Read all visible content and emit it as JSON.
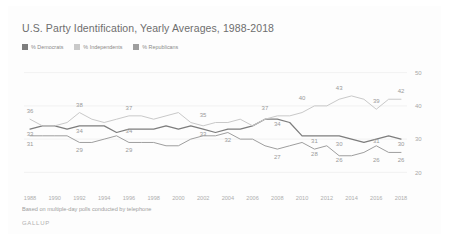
{
  "chart_data": {
    "type": "line",
    "title": "U.S. Party Identification, Yearly Averages, 1988-2018",
    "xlabel": "",
    "ylabel": "",
    "ylim": [
      15,
      52
    ],
    "xlim": [
      1988,
      2018
    ],
    "grid": true,
    "legend_position": "top-left",
    "footnote": "Based on multiple-day polls conducted by telephone",
    "brand": "GALLUP",
    "yticks": [
      50,
      40,
      30,
      20
    ],
    "xticks": [
      1988,
      1990,
      1992,
      1994,
      1996,
      1998,
      2000,
      2002,
      2004,
      2006,
      2008,
      2010,
      2012,
      2014,
      2016,
      2018
    ],
    "x": [
      1988,
      1989,
      1990,
      1991,
      1992,
      1993,
      1994,
      1995,
      1996,
      1997,
      1998,
      1999,
      2000,
      2001,
      2002,
      2003,
      2004,
      2005,
      2006,
      2007,
      2008,
      2009,
      2010,
      2011,
      2012,
      2013,
      2014,
      2015,
      2016,
      2017,
      2018
    ],
    "series": [
      {
        "name": "% Democrats",
        "color": "#7d7d7d",
        "values": [
          33,
          34,
          34,
          33,
          34,
          34,
          34,
          32,
          33,
          33,
          33,
          34,
          33,
          34,
          33,
          32,
          33,
          33,
          34,
          36,
          36,
          35,
          31,
          31,
          31,
          31,
          30,
          29,
          30,
          31,
          30
        ]
      },
      {
        "name": "% Independents",
        "color": "#c9c9c9",
        "values": [
          36,
          34,
          34,
          35,
          38,
          36,
          35,
          36,
          37,
          37,
          36,
          37,
          38,
          35,
          34,
          35,
          35,
          36,
          34,
          36,
          37,
          37,
          38,
          40,
          40,
          42,
          43,
          42,
          39,
          42,
          42
        ]
      },
      {
        "name": "% Republicans",
        "color": "#9e9e9e",
        "values": [
          31,
          31,
          31,
          31,
          29,
          29,
          30,
          31,
          29,
          29,
          29,
          28,
          28,
          30,
          31,
          31,
          32,
          30,
          30,
          28,
          27,
          28,
          29,
          27,
          28,
          25,
          25,
          26,
          28,
          26,
          26
        ]
      }
    ],
    "point_labels": [
      {
        "series": "% Independents",
        "year": 1988,
        "value": 36,
        "text": "36"
      },
      {
        "series": "% Democrats",
        "year": 1988,
        "value": 33,
        "text": "33"
      },
      {
        "series": "% Republicans",
        "year": 1988,
        "value": 31,
        "text": "31"
      },
      {
        "series": "% Independents",
        "year": 1992,
        "value": 38,
        "text": "38"
      },
      {
        "series": "% Democrats",
        "year": 1992,
        "value": 34,
        "text": "34"
      },
      {
        "series": "% Republicans",
        "year": 1992,
        "value": 29,
        "text": "29"
      },
      {
        "series": "% Independents",
        "year": 1996,
        "value": 37,
        "text": "37"
      },
      {
        "series": "% Democrats",
        "year": 1996,
        "value": 34,
        "text": "34"
      },
      {
        "series": "% Republicans",
        "year": 1996,
        "value": 29,
        "text": "29"
      },
      {
        "series": "% Independents",
        "year": 2002,
        "value": 35,
        "text": "35"
      },
      {
        "series": "% Democrats",
        "year": 2002,
        "value": 33,
        "text": "33"
      },
      {
        "series": "% Republicans",
        "year": 2004,
        "value": 32,
        "text": "32"
      },
      {
        "series": "% Independents",
        "year": 2007,
        "value": 37,
        "text": "37"
      },
      {
        "series": "% Democrats",
        "year": 2008,
        "value": 36,
        "text": "34"
      },
      {
        "series": "% Republicans",
        "year": 2008,
        "value": 27,
        "text": "27"
      },
      {
        "series": "% Independents",
        "year": 2010,
        "value": 40,
        "text": "40"
      },
      {
        "series": "% Democrats",
        "year": 2011,
        "value": 31,
        "text": "31"
      },
      {
        "series": "% Republicans",
        "year": 2011,
        "value": 28,
        "text": "28"
      },
      {
        "series": "% Independents",
        "year": 2013,
        "value": 43,
        "text": "43"
      },
      {
        "series": "% Democrats",
        "year": 2013,
        "value": 30,
        "text": "30"
      },
      {
        "series": "% Republicans",
        "year": 2013,
        "value": 26,
        "text": "26"
      },
      {
        "series": "% Independents",
        "year": 2016,
        "value": 39,
        "text": "39"
      },
      {
        "series": "% Democrats",
        "year": 2016,
        "value": 31,
        "text": "31"
      },
      {
        "series": "% Republicans",
        "year": 2016,
        "value": 26,
        "text": "26"
      },
      {
        "series": "% Independents",
        "year": 2018,
        "value": 42,
        "text": "42"
      },
      {
        "series": "% Democrats",
        "year": 2018,
        "value": 30,
        "text": "30"
      },
      {
        "series": "% Republicans",
        "year": 2018,
        "value": 26,
        "text": "26"
      }
    ]
  }
}
